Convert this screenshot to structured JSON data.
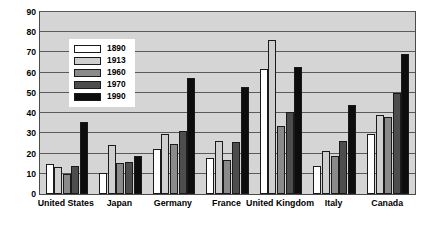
{
  "chart_data": {
    "type": "bar",
    "title": "",
    "xlabel": "",
    "ylabel": "Merchandise trade as % of merchandise value-added",
    "ylim": [
      0,
      90
    ],
    "yticks": [
      "0",
      "10",
      "20",
      "30",
      "40",
      "50",
      "60",
      "70",
      "80",
      "90"
    ],
    "grid": true,
    "legend_position": "upper-left-inside",
    "categories": [
      "United States",
      "Japan",
      "Germany",
      "France",
      "United Kingdom",
      "Italy",
      "Canada"
    ],
    "series": [
      {
        "name": "1890",
        "color": "#ffffff",
        "values": [
          14.7,
          10.5,
          22.5,
          18.0,
          62.0,
          14.0,
          29.5
        ]
      },
      {
        "name": "1913",
        "color": "#cfcfcf",
        "values": [
          13.2,
          24.0,
          29.5,
          26.0,
          76.3,
          21.5,
          39.0
        ]
      },
      {
        "name": "1960",
        "color": "#8a8a8a",
        "values": [
          9.9,
          15.5,
          24.5,
          16.8,
          33.8,
          19.0,
          38.0
        ]
      },
      {
        "name": "1970",
        "color": "#4d4d4d",
        "values": [
          13.8,
          15.9,
          31.3,
          25.7,
          40.7,
          26.0,
          50.0
        ]
      },
      {
        "name": "1990",
        "color": "#0d0d0d",
        "values": [
          35.8,
          18.9,
          57.3,
          53.0,
          62.8,
          43.9,
          69.0
        ]
      }
    ]
  },
  "legend": {
    "items": [
      {
        "label": "1890"
      },
      {
        "label": "1913"
      },
      {
        "label": "1960"
      },
      {
        "label": "1970"
      },
      {
        "label": "1990"
      }
    ]
  },
  "colors": {
    "plot_background": "#d5d5d5",
    "gridline": "#5a5a5a",
    "axis": "#4a4a4a",
    "bar_outline": "#1a1a1a",
    "page_background": "#ffffff"
  }
}
